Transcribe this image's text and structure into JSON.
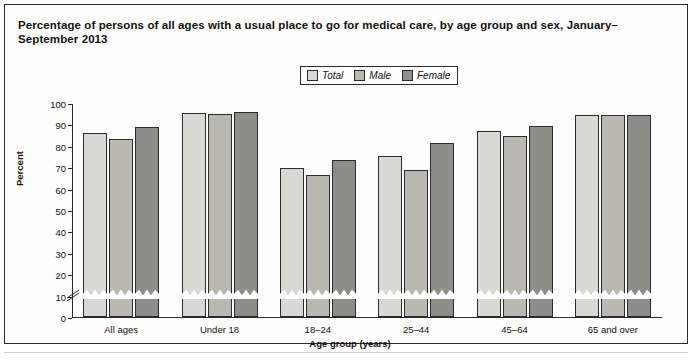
{
  "title": "Percentage of persons of all ages with a usual place to go for medical care, by age group and sex, January–September 2013",
  "legend": {
    "items": [
      {
        "label": "Total",
        "color": "#d9d9d4"
      },
      {
        "label": "Male",
        "color": "#b9b9b2"
      },
      {
        "label": "Female",
        "color": "#8e8e88"
      }
    ]
  },
  "chart_data": {
    "type": "bar",
    "title": "Percentage of persons of all ages with a usual place to go for medical care, by age group and sex, January–September 2013",
    "xlabel": "Age group (years)",
    "ylabel": "Percent",
    "categories": [
      "All ages",
      "Under 18",
      "18–24",
      "25–44",
      "45–64",
      "65 and over"
    ],
    "series": [
      {
        "name": "Total",
        "values": [
          86.2,
          95.5,
          69.7,
          75.1,
          86.9,
          94.6
        ]
      },
      {
        "name": "Male",
        "values": [
          83.4,
          95.0,
          66.2,
          68.7,
          84.6,
          94.3
        ]
      },
      {
        "name": "Female",
        "values": [
          88.8,
          95.9,
          73.5,
          81.1,
          89.2,
          94.4
        ]
      }
    ],
    "yticks": [
      0,
      10,
      20,
      30,
      40,
      50,
      60,
      70,
      80,
      90,
      100
    ],
    "ylim": [
      0,
      100
    ],
    "y_axis_break": true,
    "grid": false,
    "legend_position": "top-center"
  }
}
